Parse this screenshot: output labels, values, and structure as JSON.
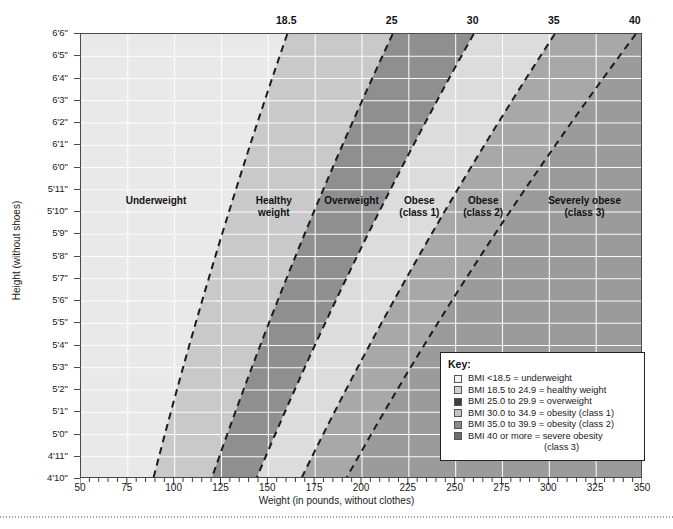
{
  "chart_data": {
    "type": "area",
    "title": "",
    "xlabel": "Weight (in pounds, without clothes)",
    "ylabel": "Height (without shoes)",
    "xlim": [
      50,
      350
    ],
    "ylim_inches": [
      58,
      78
    ],
    "x_ticks": [
      50,
      75,
      100,
      125,
      150,
      175,
      200,
      225,
      250,
      275,
      300,
      325,
      350
    ],
    "x_tick_labels": [
      "50",
      "75",
      "100",
      "125",
      "150",
      "175",
      "200",
      "225",
      "250",
      "275",
      "300",
      "325",
      "350"
    ],
    "x_minor_step": 5,
    "y_tick_labels": [
      "6'6\"",
      "6'5\"",
      "6'4\"",
      "6'3\"",
      "6'2\"",
      "6'1\"",
      "6'0\"",
      "5'11\"",
      "5'10\"",
      "5'9\"",
      "5'8\"",
      "5'7\"",
      "5'6\"",
      "5'5\"",
      "5'4\"",
      "5'3\"",
      "5'2\"",
      "5'1\"",
      "5'0\"",
      "4'11\"",
      "4'10\""
    ],
    "y_tick_inches": [
      78,
      77,
      76,
      75,
      74,
      73,
      72,
      71,
      70,
      69,
      68,
      67,
      66,
      65,
      64,
      63,
      62,
      61,
      60,
      59,
      58
    ],
    "top_axis_label": "BMI",
    "top_tick_values": [
      18.5,
      25,
      30,
      35,
      40
    ],
    "top_tick_labels": [
      "18.5",
      "25",
      "30",
      "35",
      "40"
    ],
    "grid": true,
    "legend_position": "inside-bottom-right",
    "boundaries_bmi": [
      18.5,
      25,
      30,
      35,
      40
    ],
    "bands": [
      {
        "name": "Underweight",
        "label": "Underweight",
        "bmi_min": 0,
        "bmi_max": 18.5,
        "color": "#e9e9e9"
      },
      {
        "name": "Healthy weight",
        "label": "Healthy\nweight",
        "bmi_min": 18.5,
        "bmi_max": 25,
        "color": "#c9c9c9"
      },
      {
        "name": "Overweight",
        "label": "Overweight",
        "bmi_min": 25,
        "bmi_max": 30,
        "color": "#8f8f8f"
      },
      {
        "name": "Obese (class 1)",
        "label": "Obese\n(class 1)",
        "bmi_min": 30,
        "bmi_max": 35,
        "color": "#dcdcdc"
      },
      {
        "name": "Obese (class 2)",
        "label": "Obese\n(class 2)",
        "bmi_min": 35,
        "bmi_max": 40,
        "color": "#a8a8a8"
      },
      {
        "name": "Severely obese (class 3)",
        "label": "Severely obese\n(class 3)",
        "bmi_min": 40,
        "bmi_max": 99,
        "color": "#9b9b9b"
      }
    ]
  },
  "axes": {
    "x_title": "Weight (in pounds, without clothes)",
    "y_title": "Height (without shoes)"
  },
  "top_axis": {
    "labels": [
      "18.5",
      "25",
      "30",
      "35",
      "40"
    ]
  },
  "band_labels": {
    "underweight": "Underweight",
    "healthy_weight": "Healthy\nweight",
    "overweight": "Overweight",
    "obese_class1": "Obese\n(class 1)",
    "obese_class2": "Obese\n(class 2)",
    "severely_obese": "Severely obese\n(class 3)"
  },
  "legend": {
    "title": "Key:",
    "items": [
      {
        "swatch": "#f2f2f2",
        "text": "BMI <18.5 = underweight"
      },
      {
        "swatch": "#d2d2d2",
        "text": "BMI 18.5 to 24.9 = healthy weight"
      },
      {
        "swatch": "#3f3f3f",
        "text": "BMI 25.0 to 29.9 = overweight"
      },
      {
        "swatch": "#c4c4c4",
        "text": "BMI 30.0 to 34.9 = obesity (class 1)"
      },
      {
        "swatch": "#8a8a8a",
        "text": "BMI 35.0 to 39.9 = obesity (class 2)"
      },
      {
        "swatch": "#6e6e6e",
        "text": "BMI 40 or more = severe obesity"
      }
    ],
    "continuation": "(class 3)"
  },
  "colors": {
    "frame": "#4a4a4a",
    "grid": "#ffffff",
    "dash": "#1c1c1c",
    "text": "#1a1a1a"
  }
}
